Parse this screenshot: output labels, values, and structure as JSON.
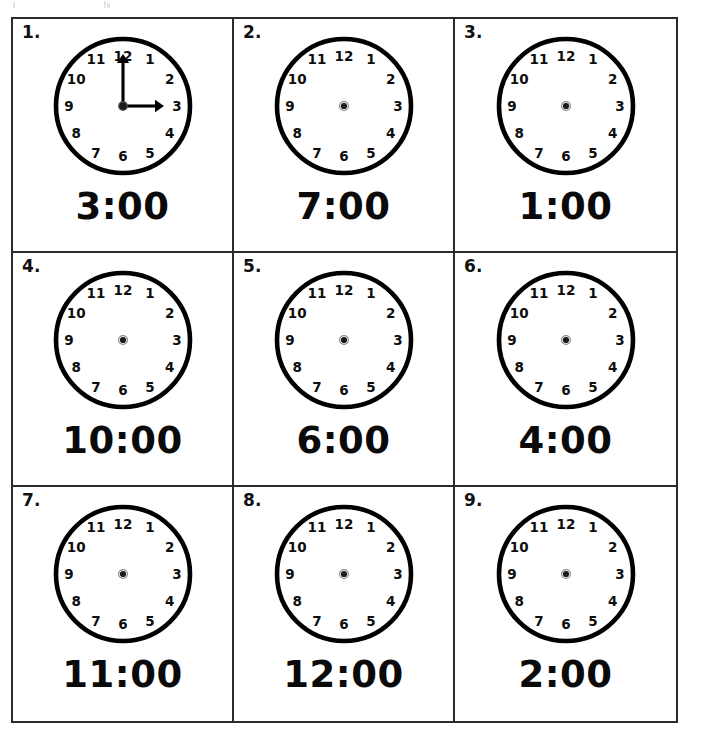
{
  "worksheet": {
    "title": "Telling Time Clock Worksheet",
    "rows": 3,
    "columns": 3,
    "clock_numerals": [
      "12",
      "1",
      "2",
      "3",
      "4",
      "5",
      "6",
      "7",
      "8",
      "9",
      "10",
      "11"
    ],
    "items": [
      {
        "number": "1.",
        "time_label": "3:00",
        "hour": 3,
        "minute": 0,
        "hands_shown": true,
        "hour_hand_target": "3",
        "minute_hand_target": "12"
      },
      {
        "number": "2.",
        "time_label": "7:00",
        "hour": 7,
        "minute": 0,
        "hands_shown": false,
        "hour_hand_target": "",
        "minute_hand_target": ""
      },
      {
        "number": "3.",
        "time_label": "1:00",
        "hour": 1,
        "minute": 0,
        "hands_shown": false,
        "hour_hand_target": "",
        "minute_hand_target": ""
      },
      {
        "number": "4.",
        "time_label": "10:00",
        "hour": 10,
        "minute": 0,
        "hands_shown": false,
        "hour_hand_target": "",
        "minute_hand_target": ""
      },
      {
        "number": "5.",
        "time_label": "6:00",
        "hour": 6,
        "minute": 0,
        "hands_shown": false,
        "hour_hand_target": "",
        "minute_hand_target": ""
      },
      {
        "number": "6.",
        "time_label": "4:00",
        "hour": 4,
        "minute": 0,
        "hands_shown": false,
        "hour_hand_target": "",
        "minute_hand_target": ""
      },
      {
        "number": "7.",
        "time_label": "11:00",
        "hour": 11,
        "minute": 0,
        "hands_shown": false,
        "hour_hand_target": "",
        "minute_hand_target": ""
      },
      {
        "number": "8.",
        "time_label": "12:00",
        "hour": 12,
        "minute": 0,
        "hands_shown": false,
        "hour_hand_target": "",
        "minute_hand_target": ""
      },
      {
        "number": "9.",
        "time_label": "2:00",
        "hour": 2,
        "minute": 0,
        "hands_shown": false,
        "hour_hand_target": "",
        "minute_hand_target": ""
      }
    ]
  },
  "colors": {
    "ink": "#000000",
    "grid_border": "#2b2b2b",
    "paper": "#ffffff",
    "hub": "#1b1b1b"
  }
}
